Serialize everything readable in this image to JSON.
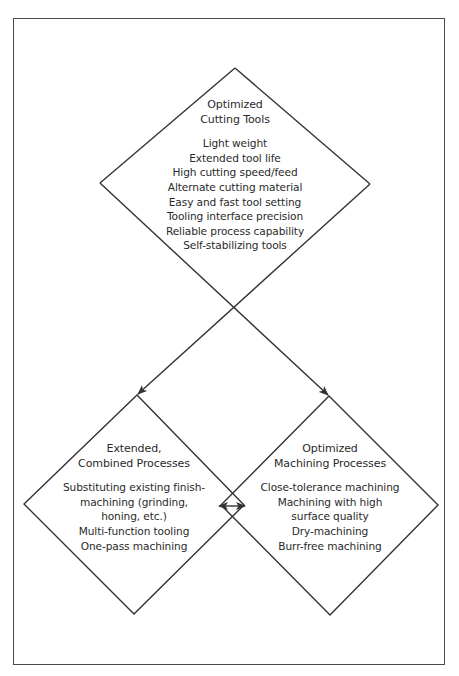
{
  "diagram": {
    "colors": {
      "line": "#333333",
      "text": "#2a2a2a",
      "frame": "#4a4a4a",
      "background": "#ffffff"
    },
    "nodes": [
      {
        "id": "optimized-cutting-tools",
        "title": [
          "Optimized",
          "Cutting Tools"
        ],
        "items": [
          "Light weight",
          "Extended tool life",
          "High cutting speed/feed",
          "Alternate cutting material",
          "Easy and fast tool setting",
          "Tooling interface precision",
          "Reliable process capability",
          "Self-stabilizing tools"
        ]
      },
      {
        "id": "extended-combined-processes",
        "title": [
          "Extended,",
          "Combined Processes"
        ],
        "items": [
          "Substituting existing finish-",
          "machining (grinding,",
          "honing, etc.)",
          "Multi-function tooling",
          "One-pass machining"
        ]
      },
      {
        "id": "optimized-machining-processes",
        "title": [
          "Optimized",
          "Machining Processes"
        ],
        "items": [
          "Close-tolerance machining",
          "Machining with high",
          "surface quality",
          "Dry-machining",
          "Burr-free machining"
        ]
      }
    ],
    "edges": [
      {
        "from": "optimized-cutting-tools",
        "to": "extended-combined-processes",
        "type": "arrow"
      },
      {
        "from": "optimized-cutting-tools",
        "to": "optimized-machining-processes",
        "type": "arrow"
      },
      {
        "from": "extended-combined-processes",
        "to": "optimized-machining-processes",
        "type": "double-arrow"
      }
    ]
  }
}
